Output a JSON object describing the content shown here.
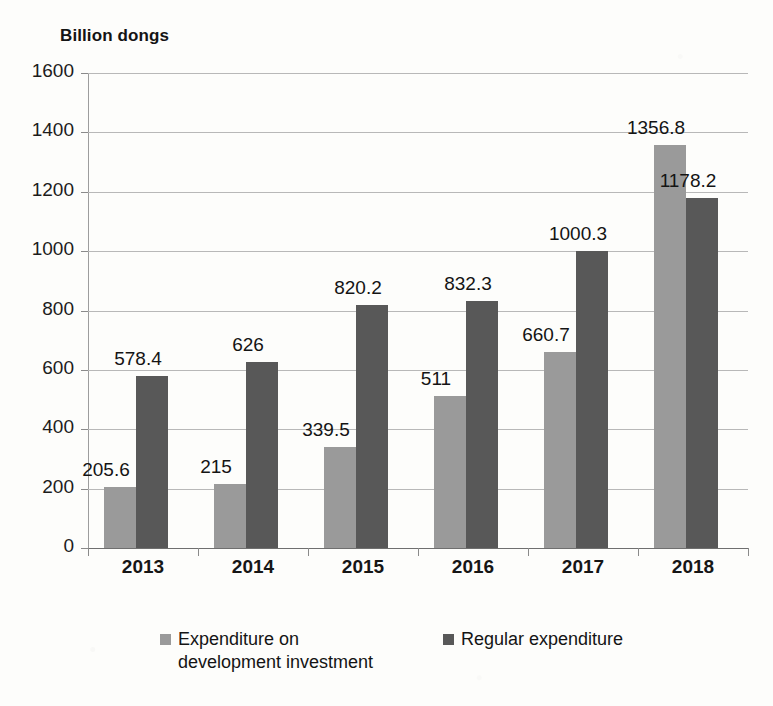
{
  "chart_data": {
    "type": "bar",
    "title": "",
    "unit_label": "Billion dongs",
    "xlabel": "",
    "ylabel": "Billion dongs",
    "categories": [
      "2013",
      "2014",
      "2015",
      "2016",
      "2017",
      "2018"
    ],
    "series": [
      {
        "name": "Expenditure on\ndevelopment investment",
        "color": "#9a9a9a",
        "values": [
          205.6,
          215,
          339.5,
          511,
          660.7,
          1356.8
        ],
        "labels": [
          "205.6",
          "215",
          "339.5",
          "511",
          "660.7",
          "1356.8"
        ]
      },
      {
        "name": "Regular expenditure",
        "color": "#585858",
        "values": [
          578.4,
          626,
          820.2,
          832.3,
          1000.3,
          1178.2
        ],
        "labels": [
          "578.4",
          "626",
          "820.2",
          "832.3",
          "1000.3",
          "1178.2"
        ]
      }
    ],
    "ylim": [
      0,
      1600
    ],
    "ytick_values": [
      0,
      200,
      400,
      600,
      800,
      1000,
      1200,
      1400,
      1600
    ],
    "ytick_labels": [
      "0",
      "200",
      "400",
      "600",
      "800",
      "1000",
      "1200",
      "1400",
      "1600"
    ],
    "grid": true,
    "legend_position": "bottom",
    "background_color": "#fdfdfb"
  }
}
